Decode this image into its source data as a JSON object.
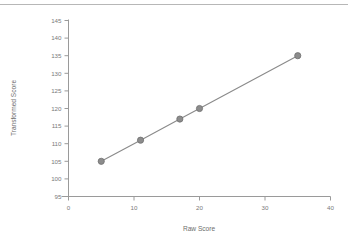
{
  "figure": {
    "background": "#ffffff",
    "top_rule_color": "#b7b7b7",
    "axis_color": "#9a9a9a",
    "line_color": "#8a8a8a",
    "marker_color": "#8c8c8c",
    "marker_edge_color": "#6f6f6f",
    "text_color": "#7a7a7a"
  },
  "chart_data": {
    "type": "line",
    "title": "",
    "xlabel": "Raw Score",
    "ylabel": "Transformed Score",
    "xlim": [
      0,
      40
    ],
    "ylim": [
      95,
      145
    ],
    "xticks": [
      0,
      10,
      20,
      30,
      40
    ],
    "xtick_labels": [
      "0",
      "10",
      "20",
      "30",
      "40"
    ],
    "yticks": [
      95,
      100,
      105,
      110,
      115,
      120,
      125,
      130,
      135,
      140,
      145
    ],
    "ytick_labels": [
      "95",
      "100",
      "105",
      "110",
      "115",
      "120",
      "125",
      "130",
      "135",
      "140",
      "145"
    ],
    "grid": false,
    "legend": false,
    "marker": "circle",
    "series": [
      {
        "name": "Transformed Score",
        "x": [
          5,
          11,
          17,
          20,
          35
        ],
        "values": [
          105,
          111,
          117,
          120,
          135
        ],
        "points": [
          {
            "x": 5,
            "y": 105
          },
          {
            "x": 11,
            "y": 111
          },
          {
            "x": 17,
            "y": 117
          },
          {
            "x": 20,
            "y": 120
          },
          {
            "x": 35,
            "y": 135
          }
        ]
      }
    ]
  }
}
